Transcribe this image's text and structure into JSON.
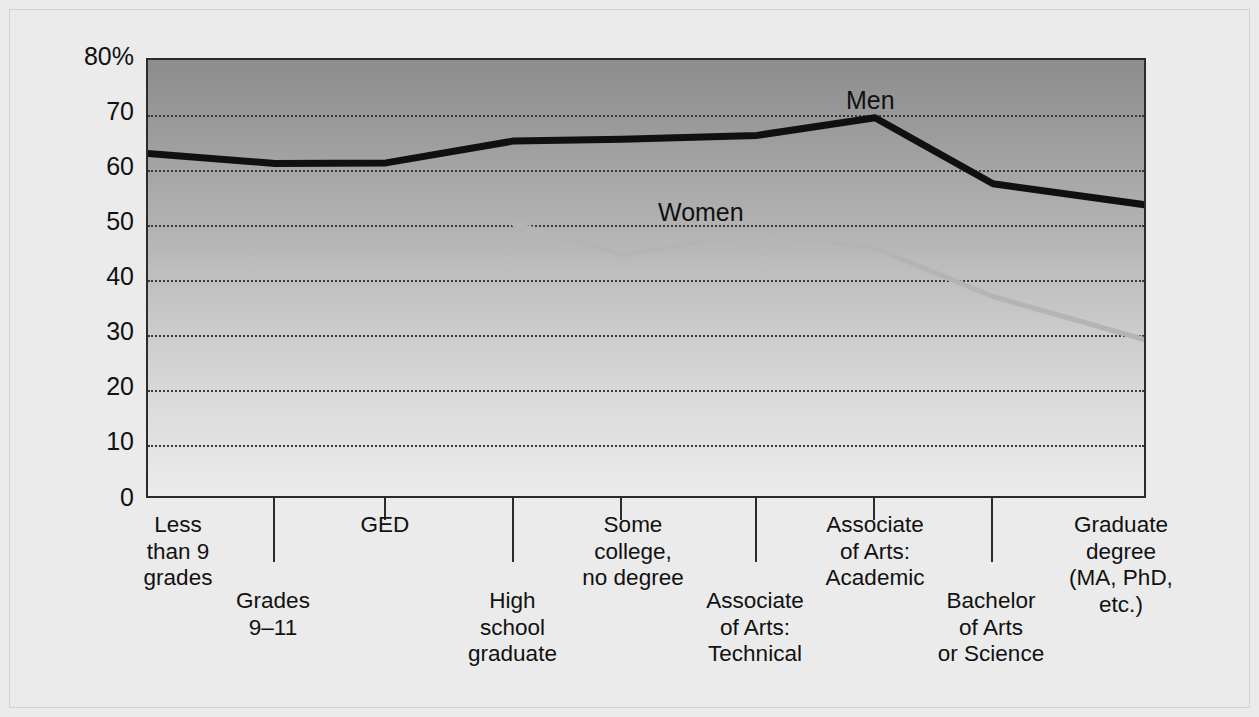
{
  "chart_data": {
    "type": "line",
    "title": "",
    "subtitle": "",
    "xlabel": "",
    "ylabel": "",
    "ylim": [
      0,
      80
    ],
    "grid": true,
    "grid_axis": "y",
    "legend_position": "inline-annotation",
    "y_ticks": [
      "80%",
      "70",
      "60",
      "50",
      "40",
      "30",
      "20",
      "10",
      "0"
    ],
    "y_tick_values": [
      80,
      70,
      60,
      50,
      40,
      30,
      20,
      10,
      0
    ],
    "categories": [
      "Less\nthan 9\ngrades",
      "Grades\n9–11",
      "GED",
      "High\nschool\ngraduate",
      "Some\ncollege,\nno degree",
      "Associate\nof Arts:\nTechnical",
      "Associate\nof Arts:\nAcademic",
      "Bachelor\nof Arts\nor Science",
      "Graduate\ndegree\n(MA, PhD,\netc.)"
    ],
    "series": [
      {
        "name": "Men",
        "color": "#101010",
        "values": [
          63,
          61.2,
          61.3,
          65.3,
          65.6,
          66.3,
          69.5,
          57.5,
          53.6
        ]
      },
      {
        "name": "Women",
        "color": "#b4b4b4",
        "values": [
          null,
          null,
          null,
          50.2,
          44.6,
          48.5,
          45.8,
          37.0,
          29.0
        ]
      }
    ]
  },
  "annotations": {
    "men_label": "Men",
    "women_label": "Women"
  },
  "axis": {
    "y_labels": [
      {
        "text": "80%",
        "value": 80
      },
      {
        "text": "70",
        "value": 70
      },
      {
        "text": "60",
        "value": 60
      },
      {
        "text": "50",
        "value": 50
      },
      {
        "text": "40",
        "value": 40
      },
      {
        "text": "30",
        "value": 30
      },
      {
        "text": "20",
        "value": 20
      },
      {
        "text": "10",
        "value": 10
      },
      {
        "text": "0",
        "value": 0
      }
    ],
    "x_labels": [
      {
        "text": "Less\nthan 9\ngrades"
      },
      {
        "text": "Grades\n9–11"
      },
      {
        "text": "GED"
      },
      {
        "text": "High\nschool\ngraduate"
      },
      {
        "text": "Some\ncollege,\nno degree"
      },
      {
        "text": "Associate\nof Arts:\nTechnical"
      },
      {
        "text": "Associate\nof Arts:\nAcademic"
      },
      {
        "text": "Bachelor\nof Arts\nor Science"
      },
      {
        "text": "Graduate\ndegree\n(MA, PhD,\netc.)"
      }
    ]
  },
  "colors": {
    "page_background": "#ebebeb",
    "plot_top": "#8d8d8d",
    "plot_bottom": "#ececec",
    "axis_line": "#2b2b2b",
    "gridline": "#3a3a3a",
    "men_line": "#101010",
    "women_line": "#b4b4b4",
    "text": "#111111"
  }
}
